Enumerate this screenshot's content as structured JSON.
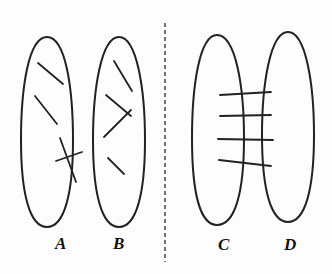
{
  "diagram": {
    "colors": {
      "stroke": "#222222",
      "background": "#fdfdfd"
    },
    "panels": {
      "left": {
        "ellipses": [
          {
            "label": "A",
            "cx": 47,
            "cy": 132,
            "rx": 26,
            "ry": 95,
            "segments": [
              [
                38,
                63,
                63,
                84
              ],
              [
                35,
                96,
                57,
                124
              ],
              [
                60,
                138,
                76,
                182
              ],
              [
                55,
                161,
                82,
                152
              ]
            ]
          },
          {
            "label": "B",
            "cx": 119,
            "cy": 132,
            "rx": 26,
            "ry": 95,
            "segments": [
              [
                114,
                61,
                132,
                91
              ],
              [
                106,
                95,
                131,
                116
              ],
              [
                104,
                137,
                131,
                110
              ],
              [
                108,
                158,
                124,
                174
              ]
            ]
          }
        ]
      },
      "divider": {
        "x": 165,
        "y1": 23,
        "y2": 262,
        "style": "dashed"
      },
      "right": {
        "ellipses": [
          {
            "label": "C",
            "cx": 217,
            "cy": 133,
            "rx": 26,
            "ry": 95
          },
          {
            "label": "D",
            "cx": 288,
            "cy": 128,
            "rx": 26,
            "ry": 95
          }
        ],
        "bridges": [
          [
            220,
            95,
            271,
            92
          ],
          [
            220,
            116,
            271,
            115
          ],
          [
            218,
            139,
            273,
            140
          ],
          [
            219,
            160,
            271,
            166
          ]
        ]
      }
    },
    "labels": {
      "a": "A",
      "b": "B",
      "c": "C",
      "d": "D"
    }
  }
}
